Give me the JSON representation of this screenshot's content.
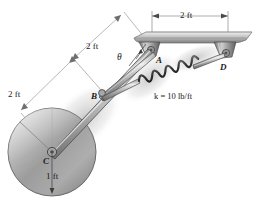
{
  "figure": {
    "colors": {
      "line": "#4a4a4a",
      "dimension_line": "#8a8a8a",
      "metal_light": "#e8e8e8",
      "metal_mid": "#a8a8a8",
      "metal_dark": "#6e6e6e",
      "text": "#1a1a1a"
    },
    "labels": {
      "dim_rod_upper": "2 ft",
      "dim_rod_lower": "2 ft",
      "dim_ceiling": "2 ft",
      "dim_wheel_radius": "1 ft",
      "point_a": "A",
      "point_b": "B",
      "point_c": "C",
      "point_d": "D",
      "angle_theta": "θ",
      "spring_stiffness": "k = 10 lb/ft",
      "spring_k_symbol": "k",
      "spring_k_value": "= 10 lb/ft"
    },
    "geometry": {
      "point_a": [
        151,
        50
      ],
      "point_b": [
        102,
        93
      ],
      "point_c": [
        52,
        152
      ],
      "point_d": [
        226,
        53
      ],
      "wheel_radius_px": 44,
      "ceiling_y": 36
    },
    "icons": {
      "wheel": "wheel-disc",
      "spring": "coil-spring",
      "bracket": "pin-bracket",
      "ceiling": "ceiling-plate",
      "arrow": "dimension-arrow"
    }
  }
}
